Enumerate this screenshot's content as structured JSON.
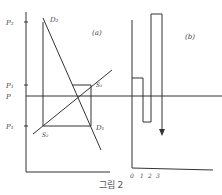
{
  "figure": {
    "caption": "그림 2",
    "panel_a": {
      "label": "(a)",
      "y_labels": {
        "p2": "P₂",
        "p1_upper": "P₁",
        "p": "P",
        "p1_lower": "P₁"
      },
      "curve_labels": {
        "demand_2": "D₂",
        "demand_1": "D₁",
        "supply_1": "S₁",
        "supply_2": "S₂"
      }
    },
    "panel_b": {
      "label": "(b)",
      "x_ticks": [
        "0",
        "1",
        "2",
        "3"
      ]
    }
  },
  "colors": {
    "line": "#333333",
    "background": "#ffffff"
  }
}
